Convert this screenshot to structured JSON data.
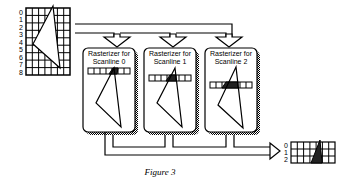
{
  "figure": {
    "caption": "Figure 3",
    "colors": {
      "line": "#000000",
      "background": "#ffffff",
      "shadow": "#555555",
      "fill_dark": "#222222"
    }
  },
  "input_grid": {
    "row_labels": [
      "0",
      "1",
      "2",
      "3",
      "4",
      "5",
      "6",
      "7",
      "8"
    ],
    "rows": 9,
    "cols": 7
  },
  "rasterizers": [
    {
      "title_line1": "Rasterizer for",
      "title_line2": "Scanline 0",
      "scanline": 0
    },
    {
      "title_line1": "Rasterizer for",
      "title_line2": "Scanline 1",
      "scanline": 1
    },
    {
      "title_line1": "Rasterizer for",
      "title_line2": "Scanline 2",
      "scanline": 2
    }
  ],
  "output_grid": {
    "row_labels": [
      "0",
      "1",
      "2"
    ],
    "rows": 3,
    "cols": 7
  }
}
